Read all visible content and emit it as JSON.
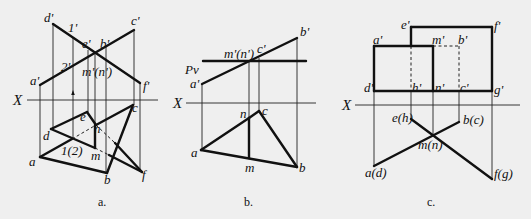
{
  "figure": {
    "panels": [
      {
        "id": "a",
        "caption": "a.",
        "caption_pos": [
          98,
          206
        ],
        "x_axis": {
          "label": "X",
          "label_pos": [
            13,
            105
          ],
          "from": [
            27,
            100
          ],
          "to": [
            158,
            100
          ]
        },
        "labels": [
          {
            "text": "d'",
            "x": 44,
            "y": 22
          },
          {
            "text": "1'",
            "x": 68,
            "y": 32
          },
          {
            "text": "e'",
            "x": 82,
            "y": 48
          },
          {
            "text": "b'",
            "x": 100,
            "y": 48
          },
          {
            "text": "c'",
            "x": 131,
            "y": 25
          },
          {
            "text": "2'",
            "x": 61,
            "y": 71
          },
          {
            "text": "m'(n')",
            "x": 82,
            "y": 76
          },
          {
            "text": "a'",
            "x": 30,
            "y": 85
          },
          {
            "text": "f'",
            "x": 143,
            "y": 90
          },
          {
            "text": "c",
            "x": 132,
            "y": 112
          },
          {
            "text": "e",
            "x": 80,
            "y": 121
          },
          {
            "text": "n",
            "x": 94,
            "y": 133
          },
          {
            "text": "d",
            "x": 43,
            "y": 140
          },
          {
            "text": "1(2)",
            "x": 61,
            "y": 155
          },
          {
            "text": "m",
            "x": 91,
            "y": 160
          },
          {
            "text": "a",
            "x": 29,
            "y": 166
          },
          {
            "text": "b",
            "x": 104,
            "y": 184
          },
          {
            "text": "f",
            "x": 142,
            "y": 179
          }
        ],
        "thin_lines": [
          [
            53,
            24,
            53,
            129
          ],
          [
            73,
            38,
            73,
            138
          ],
          [
            88,
            50,
            88,
            112
          ],
          [
            95,
            53,
            95,
            125
          ],
          [
            106,
            47,
            106,
            172
          ],
          [
            134,
            30,
            134,
            105
          ],
          [
            40,
            85,
            40,
            157
          ],
          [
            140,
            83,
            140,
            172
          ]
        ],
        "thick_lines": [
          [
            53,
            24,
            140,
            83
          ],
          [
            40,
            85,
            134,
            30
          ],
          [
            51,
            129,
            87,
            112
          ],
          [
            87,
            112,
            96,
            125
          ],
          [
            40,
            157,
            72,
            139
          ],
          [
            96,
            125,
            133,
            105
          ],
          [
            51,
            129,
            95,
            148
          ],
          [
            95,
            125,
            95,
            148
          ],
          [
            133,
            105,
            107,
            173
          ],
          [
            40,
            157,
            107,
            173
          ],
          [
            115,
            143,
            142,
            172
          ],
          [
            109,
            155,
            142,
            172
          ]
        ],
        "dashed_lines": [
          [
            72,
            139,
            96,
            125
          ],
          [
            96,
            125,
            115,
            143
          ],
          [
            95,
            148,
            109,
            155
          ]
        ],
        "arrow": {
          "x": 73,
          "y1": 97,
          "y2": 90
        }
      },
      {
        "id": "b",
        "caption": "b.",
        "caption_pos": [
          244,
          206
        ],
        "x_axis": {
          "label": "X",
          "label_pos": [
            173,
            108
          ],
          "from": [
            186,
            103
          ],
          "to": [
            316,
            103
          ]
        },
        "pv_label": {
          "text": "Pv",
          "x": 185,
          "y": 74
        },
        "labels": [
          {
            "text": "b'",
            "x": 300,
            "y": 36
          },
          {
            "text": "m'(n')",
            "x": 224,
            "y": 58
          },
          {
            "text": "c'",
            "x": 257,
            "y": 53
          },
          {
            "text": "a'",
            "x": 190,
            "y": 88
          },
          {
            "text": "n",
            "x": 240,
            "y": 118
          },
          {
            "text": "c",
            "x": 262,
            "y": 115
          },
          {
            "text": "a",
            "x": 191,
            "y": 157
          },
          {
            "text": "m",
            "x": 245,
            "y": 172
          },
          {
            "text": "b",
            "x": 299,
            "y": 172
          }
        ],
        "thin_lines": [
          [
            202,
            84,
            202,
            150
          ],
          [
            249,
            61,
            249,
            118
          ],
          [
            259,
            58,
            259,
            111
          ],
          [
            297,
            38,
            297,
            167
          ]
        ],
        "thick_lines": [
          [
            203,
            61,
            306,
            61
          ],
          [
            202,
            84,
            297,
            38
          ],
          [
            201,
            150,
            249,
            118
          ],
          [
            249,
            118,
            259,
            111
          ],
          [
            259,
            111,
            297,
            167
          ],
          [
            201,
            150,
            297,
            167
          ],
          [
            249,
            118,
            249,
            158
          ]
        ],
        "dashed_lines": []
      },
      {
        "id": "c",
        "caption": "c.",
        "caption_pos": [
          427,
          206
        ],
        "x_axis": {
          "label": "X",
          "label_pos": [
            342,
            110
          ],
          "from": [
            355,
            105
          ],
          "to": [
            520,
            105
          ]
        },
        "labels": [
          {
            "text": "e'",
            "x": 401,
            "y": 29
          },
          {
            "text": "f'",
            "x": 494,
            "y": 30
          },
          {
            "text": "a'",
            "x": 373,
            "y": 44
          },
          {
            "text": "m'",
            "x": 432,
            "y": 44
          },
          {
            "text": "b'",
            "x": 458,
            "y": 44
          },
          {
            "text": "d'",
            "x": 364,
            "y": 92
          },
          {
            "text": "h'",
            "x": 412,
            "y": 92
          },
          {
            "text": "n'",
            "x": 435,
            "y": 92
          },
          {
            "text": "c'",
            "x": 460,
            "y": 92
          },
          {
            "text": "g'",
            "x": 494,
            "y": 94
          },
          {
            "text": "e(h)",
            "x": 392,
            "y": 122
          },
          {
            "text": "b(c)",
            "x": 463,
            "y": 124
          },
          {
            "text": "m(n)",
            "x": 418,
            "y": 149
          },
          {
            "text": "a(d)",
            "x": 365,
            "y": 177
          },
          {
            "text": "f(g)",
            "x": 494,
            "y": 178
          }
        ],
        "thin_lines": [
          [
            374,
            91,
            374,
            166
          ],
          [
            411,
            91,
            411,
            119
          ],
          [
            433,
            91,
            433,
            134
          ],
          [
            459,
            91,
            459,
            122
          ],
          [
            492,
            91,
            492,
            179
          ]
        ],
        "thick_lines": [
          [
            374,
            46,
            433,
            46
          ],
          [
            374,
            46,
            374,
            91
          ],
          [
            374,
            91,
            492,
            91
          ],
          [
            433,
            46,
            433,
            91
          ],
          [
            411,
            27,
            492,
            27
          ],
          [
            411,
            27,
            411,
            46
          ],
          [
            492,
            27,
            492,
            91
          ],
          [
            374,
            166,
            459,
            122
          ],
          [
            411,
            119,
            492,
            179
          ]
        ],
        "dashed_lines": [
          [
            433,
            46,
            459,
            46
          ],
          [
            459,
            46,
            459,
            91
          ],
          [
            411,
            46,
            411,
            91
          ]
        ]
      }
    ]
  }
}
